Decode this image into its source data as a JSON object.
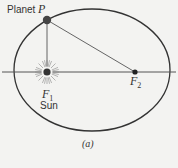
{
  "figure": {
    "caption": "(a)",
    "labels": {
      "planet": "Planet",
      "point_p": "P",
      "focus1": "F",
      "focus1_sub": "1",
      "focus2": "F",
      "focus2_sub": "2",
      "sun": "Sun"
    },
    "geometry": {
      "ellipse": {
        "cx": 92,
        "cy": 70,
        "rx": 78,
        "ry": 61
      },
      "axis_line": {
        "x1": 2,
        "x2": 176,
        "y": 72
      },
      "F1": {
        "x": 47,
        "y": 72
      },
      "F2": {
        "x": 135,
        "y": 72
      },
      "P": {
        "x": 47,
        "y": 20
      }
    },
    "colors": {
      "background": "#f3f3f1",
      "stroke": "#333333",
      "planet_fill": "#444444"
    }
  }
}
